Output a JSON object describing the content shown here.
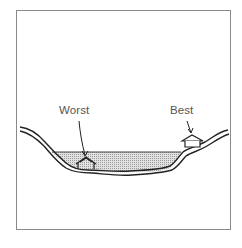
{
  "diagram": {
    "type": "flood-valley-cross-section",
    "labels": {
      "worst": "Worst",
      "best": "Best"
    },
    "colors": {
      "frame": "#8a8a8a",
      "ground_line": "#222222",
      "water_fill": "#d6d6d6",
      "label_text": "#555555"
    }
  }
}
